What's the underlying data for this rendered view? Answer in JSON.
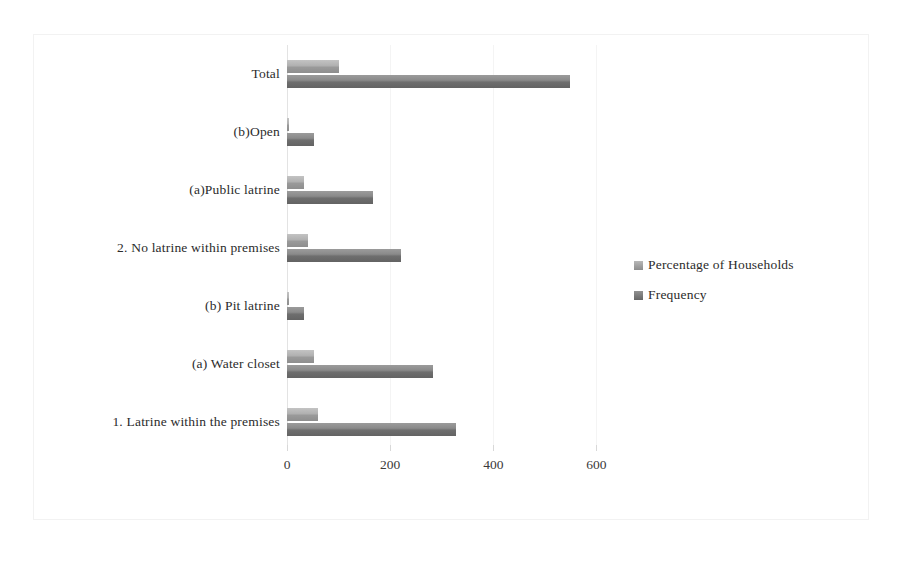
{
  "chart_data": {
    "type": "bar",
    "orientation": "horizontal",
    "title": "",
    "xlabel": "",
    "ylabel": "",
    "xlim": [
      0,
      640
    ],
    "xticks": [
      0,
      200,
      400,
      600
    ],
    "xtick_labels": [
      "0",
      "200",
      "400",
      "600"
    ],
    "grid": true,
    "legend_position": "right",
    "categories": [
      "Total",
      "(b)Open",
      "(a)Public latrine",
      "2. No latrine within premises",
      "(b) Pit latrine",
      "(a) Water closet",
      "1. Latrine within the premises"
    ],
    "series": [
      {
        "name": "Percentage of Households",
        "color": "#a8a8a8",
        "values": [
          100,
          2,
          33,
          40,
          1,
          52,
          60
        ]
      },
      {
        "name": "Frequency",
        "color": "#787878",
        "values": [
          548,
          52,
          167,
          221,
          32,
          284,
          327
        ]
      }
    ]
  },
  "legend": {
    "items": [
      {
        "label": "Percentage of Households",
        "swatch": "pct"
      },
      {
        "label": "Frequency",
        "swatch": "freq"
      }
    ]
  }
}
